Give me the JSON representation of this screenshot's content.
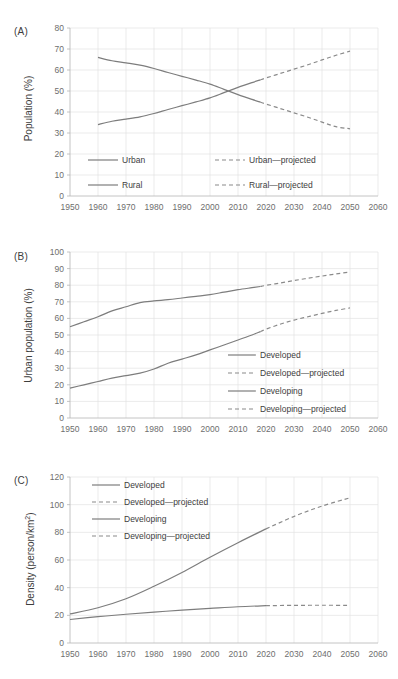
{
  "figure": {
    "panels": [
      "A",
      "B",
      "C"
    ]
  },
  "panel_a": {
    "tag": "(A)",
    "ylabel": "Population (%)",
    "legend": [
      "Urban",
      "Urban—projected",
      "Rural",
      "Rural—projected"
    ]
  },
  "panel_b": {
    "tag": "(B)",
    "ylabel": "Urban population (%)",
    "legend": [
      "Developed",
      "Developed—projected",
      "Developing",
      "Developing—projected"
    ]
  },
  "panel_c": {
    "tag": "(C)",
    "ylabel_main": "Density (person/km",
    "ylabel_sup": "2",
    "ylabel_tail": ")",
    "legend": [
      "Developed",
      "Developed—projected",
      "Developing",
      "Developing—projected"
    ]
  },
  "chart_data": [
    {
      "type": "line",
      "panel": "A",
      "title": "(A)",
      "xlabel": "",
      "ylabel": "Population (%)",
      "xlim": [
        1950,
        2060
      ],
      "ylim": [
        0,
        80
      ],
      "xticks": [
        1950,
        1960,
        1970,
        1980,
        1990,
        2000,
        2010,
        2020,
        2030,
        2040,
        2050,
        2060
      ],
      "yticks": [
        0,
        10,
        20,
        30,
        40,
        50,
        60,
        70,
        80
      ],
      "grid": true,
      "legend_position": "inside-bottom",
      "series": [
        {
          "name": "Urban",
          "style": "solid",
          "x": [
            1960,
            1965,
            1970,
            1975,
            1980,
            1985,
            1990,
            1995,
            2000,
            2005,
            2010,
            2015,
            2018
          ],
          "values": [
            34.0,
            35.6,
            36.6,
            37.7,
            39.3,
            41.2,
            43.0,
            44.8,
            46.7,
            49.2,
            51.7,
            54.0,
            55.3
          ]
        },
        {
          "name": "Urban—projected",
          "style": "dashed",
          "x": [
            2018,
            2020,
            2025,
            2030,
            2035,
            2040,
            2045,
            2050
          ],
          "values": [
            55.3,
            56.2,
            58.3,
            60.4,
            62.5,
            64.8,
            67.0,
            69.0
          ]
        },
        {
          "name": "Rural",
          "style": "solid",
          "x": [
            1960,
            1965,
            1970,
            1975,
            1980,
            1985,
            1990,
            1995,
            2000,
            2005,
            2010,
            2015,
            2018
          ],
          "values": [
            66.0,
            64.4,
            63.4,
            62.3,
            60.7,
            58.8,
            57.0,
            55.2,
            53.3,
            50.8,
            48.3,
            46.0,
            44.7
          ]
        },
        {
          "name": "Rural—projected",
          "style": "dashed",
          "x": [
            2018,
            2020,
            2025,
            2030,
            2035,
            2040,
            2045,
            2050
          ],
          "values": [
            44.7,
            43.8,
            41.7,
            39.6,
            37.5,
            35.2,
            33.0,
            32.0
          ]
        }
      ]
    },
    {
      "type": "line",
      "panel": "B",
      "title": "(B)",
      "xlabel": "",
      "ylabel": "Urban population (%)",
      "xlim": [
        1950,
        2060
      ],
      "ylim": [
        0,
        100
      ],
      "xticks": [
        1950,
        1960,
        1970,
        1980,
        1990,
        2000,
        2010,
        2020,
        2030,
        2040,
        2050,
        2060
      ],
      "yticks": [
        0,
        10,
        20,
        30,
        40,
        50,
        60,
        70,
        80,
        90,
        100
      ],
      "grid": true,
      "legend_position": "inside-right",
      "series": [
        {
          "name": "Developed",
          "style": "solid",
          "x": [
            1950,
            1955,
            1960,
            1965,
            1970,
            1975,
            1980,
            1985,
            1990,
            1995,
            2000,
            2005,
            2010,
            2015,
            2018
          ],
          "values": [
            55.0,
            58.0,
            61.0,
            64.5,
            67.0,
            69.5,
            70.5,
            71.3,
            72.3,
            73.3,
            74.3,
            75.8,
            77.3,
            78.5,
            79.2
          ]
        },
        {
          "name": "Developed—projected",
          "style": "dashed",
          "x": [
            2018,
            2020,
            2025,
            2030,
            2035,
            2040,
            2045,
            2050
          ],
          "values": [
            79.2,
            79.9,
            81.3,
            82.8,
            84.2,
            85.5,
            86.8,
            88.0
          ]
        },
        {
          "name": "Developing",
          "style": "solid",
          "x": [
            1950,
            1955,
            1960,
            1965,
            1970,
            1975,
            1980,
            1985,
            1990,
            1995,
            2000,
            2005,
            2010,
            2015,
            2018
          ],
          "values": [
            18.0,
            20.0,
            22.0,
            24.0,
            25.5,
            27.0,
            29.5,
            33.0,
            35.5,
            38.0,
            41.0,
            44.0,
            47.0,
            50.0,
            52.0
          ]
        },
        {
          "name": "Developing—projected",
          "style": "dashed",
          "x": [
            2018,
            2020,
            2025,
            2030,
            2035,
            2040,
            2045,
            2050
          ],
          "values": [
            52.0,
            53.5,
            56.5,
            59.0,
            61.0,
            63.0,
            64.8,
            66.3
          ]
        }
      ]
    },
    {
      "type": "line",
      "panel": "C",
      "title": "(C)",
      "xlabel": "",
      "ylabel": "Density (person/km2)",
      "xlim": [
        1950,
        2060
      ],
      "ylim": [
        0,
        120
      ],
      "xticks": [
        1950,
        1960,
        1970,
        1980,
        1990,
        2000,
        2010,
        2020,
        2030,
        2040,
        2050,
        2060
      ],
      "yticks": [
        0,
        20,
        40,
        60,
        80,
        100,
        120
      ],
      "grid": true,
      "legend_position": "inside-top-left",
      "series": [
        {
          "name": "Developed",
          "style": "solid",
          "x": [
            1950,
            1960,
            1970,
            1980,
            1990,
            2000,
            2010,
            2020
          ],
          "values": [
            17.0,
            19.0,
            20.8,
            22.3,
            23.8,
            25.0,
            26.2,
            27.0
          ]
        },
        {
          "name": "Developed—projected",
          "style": "dashed",
          "x": [
            2020,
            2030,
            2040,
            2050
          ],
          "values": [
            27.0,
            27.2,
            27.3,
            27.2
          ]
        },
        {
          "name": "Developing",
          "style": "solid",
          "x": [
            1950,
            1960,
            1970,
            1980,
            1990,
            2000,
            2010,
            2020
          ],
          "values": [
            21.0,
            25.5,
            32.0,
            41.0,
            51.0,
            62.0,
            72.5,
            82.5
          ]
        },
        {
          "name": "Developing—projected",
          "style": "dashed",
          "x": [
            2020,
            2030,
            2040,
            2050
          ],
          "values": [
            82.5,
            91.5,
            99.0,
            105.0
          ]
        }
      ]
    }
  ]
}
